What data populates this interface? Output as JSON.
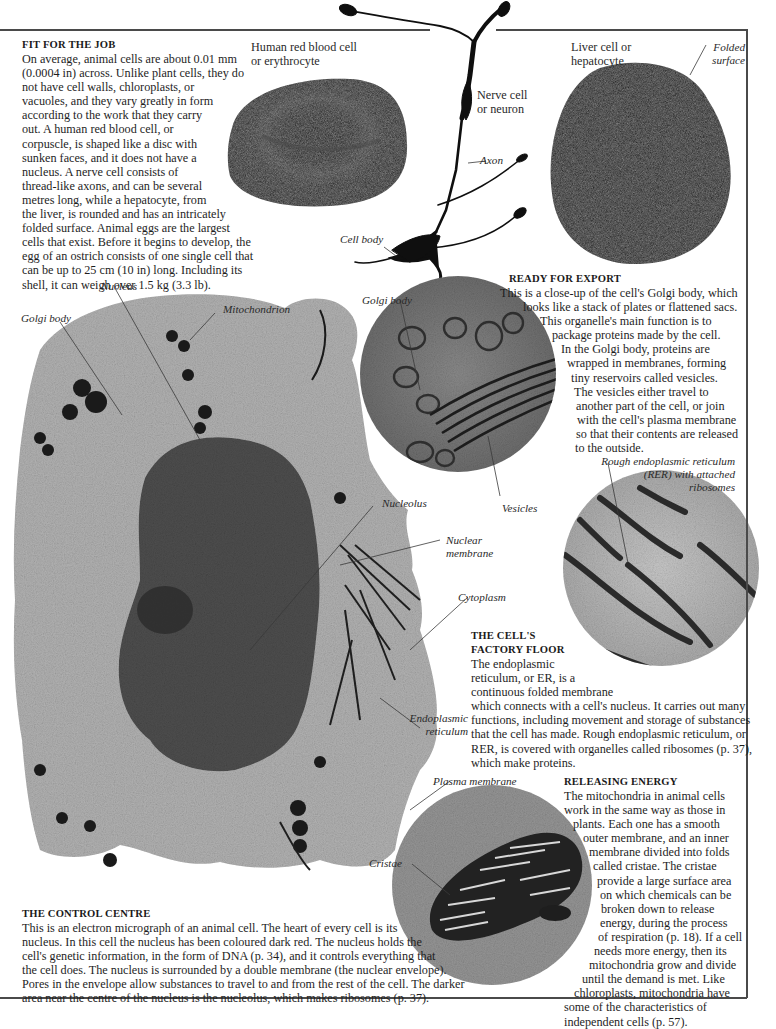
{
  "sections": {
    "fit_for_the_job": {
      "heading": "FIT FOR THE JOB",
      "lines": [
        "On average, animal cells are about 0.01 mm",
        "(0.0004 in) across. Unlike plant cells, they do",
        "not have cell walls, chloroplasts, or",
        "vacuoles, and they vary greatly in form",
        "according to the work that they carry",
        "out. A human red blood cell, or",
        "corpuscle, is shaped like a disc with",
        "sunken faces, and it does not have a",
        "nucleus. A nerve cell consists of",
        "thread-like axons, and can be several",
        "metres long, while a hepatocyte, from",
        "the liver, is rounded and has an intricately",
        "folded surface. Animal eggs are the largest",
        "cells that exist. Before it begins to develop, the",
        "egg of an ostrich consists of one single cell that",
        "can be up to 25 cm (10 in) long. Including its",
        "shell, it can weigh over 1.5 kg (3.3 lb)."
      ]
    },
    "ready_for_export": {
      "heading": "READY FOR EXPORT",
      "lines": [
        "This is a close-up of the cell's Golgi body, which",
        "looks like a stack of plates or flattened sacs.",
        "This organelle's main function is to",
        "package proteins made by the cell.",
        "In the Golgi body, proteins are",
        "wrapped in membranes, forming",
        "tiny reservoirs called vesicles.",
        "The vesicles either travel to",
        "another part of the cell, or join",
        "with the cell's plasma membrane",
        "so that their contents are released",
        "to the outside."
      ]
    },
    "factory_floor": {
      "heading_lines": [
        "THE CELL'S",
        "FACTORY FLOOR"
      ],
      "lines": [
        "The endoplasmic",
        "reticulum, or ER, is a",
        "continuous folded membrane",
        "which connects with a cell's nucleus. It carries out many",
        "functions, including movement and storage of substances",
        "that the cell has made. Rough endoplasmic reticulum, or",
        "RER, is covered with organelles called ribosomes (p. 37),",
        "which make proteins."
      ]
    },
    "releasing_energy": {
      "heading": "RELEASING ENERGY",
      "lines": [
        "The mitochondria in animal cells",
        "work in the same way as those in",
        "plants. Each one has a smooth",
        "outer membrane, and an inner",
        "membrane divided into folds",
        "called cristae. The cristae",
        "provide a large surface area",
        "on which chemicals can be",
        "broken down to release",
        "energy, during the process",
        "of respiration (p. 18). If a cell",
        "needs more energy, then its",
        "mitochondria grow and divide",
        "until the demand is met. Like",
        "chloroplasts, mitochondria have",
        "some of the characteristics of",
        "independent cells (p. 57)."
      ]
    },
    "control_centre": {
      "heading": "THE CONTROL CENTRE",
      "lines": [
        "This is an electron micrograph of an animal cell. The heart of every cell is its",
        "nucleus. In this cell the nucleus has been coloured dark red. The nucleus holds the",
        "cell's genetic information, in the form of DNA (p. 34), and it controls everything that",
        "the cell does. The nucleus is surrounded by a double membrane (the nuclear envelope).",
        "Pores in the envelope allow substances to travel to and from the rest of the cell. The darker",
        "area near the centre of the nucleus is the nucleolus, which makes ribosomes (p. 37)."
      ]
    }
  },
  "labels": {
    "red_blood_cell": [
      "Human red blood cell",
      "or erythrocyte"
    ],
    "nerve_cell": [
      "Nerve cell",
      "or neuron"
    ],
    "axon": "Axon",
    "cell_body": "Cell body",
    "liver_cell": [
      "Liver cell or",
      "hepatocyte"
    ],
    "folded_surface": [
      "Folded",
      "surface"
    ],
    "nucleus": "Nucleus",
    "mitochondrion": "Mitochondrion",
    "golgi_body_main": "Golgi body",
    "golgi_body_inset": "Golgi body",
    "vesicles": "Vesicles",
    "nucleolus": "Nucleolus",
    "nuclear_membrane": [
      "Nuclear",
      "membrane"
    ],
    "cytoplasm": "Cytoplasm",
    "rer": [
      "Rough endoplasmic reticulum",
      "(RER) with attached",
      "ribosomes"
    ],
    "endoplasmic_reticulum": [
      "Endoplasmic",
      "reticulum"
    ],
    "plasma_membrane": "Plasma membrane",
    "cristae": "Cristae"
  },
  "colors": {
    "text": "#1e1e1e",
    "rule": "#4a4a4a",
    "cell_dark": "#141414",
    "micrograph_light": "#b4b4b4",
    "micrograph_mid": "#7a7a7a",
    "nucleus": "#4a4a4a"
  }
}
